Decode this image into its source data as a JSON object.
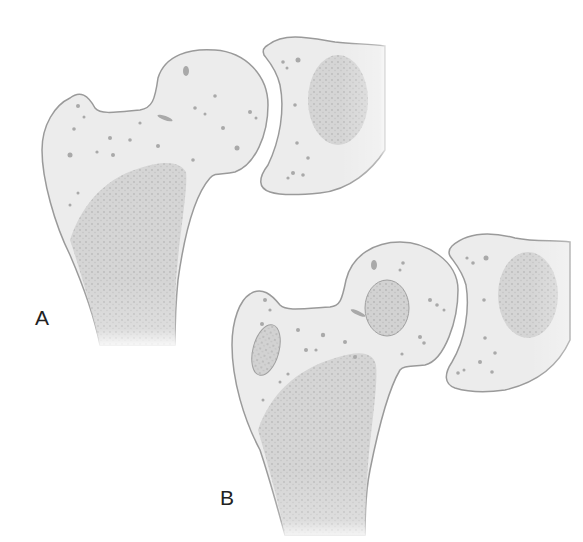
{
  "figure": {
    "panels": [
      {
        "id": "A",
        "label": "A",
        "description": "Proximal femur and acetabulum with scattered small cysts"
      },
      {
        "id": "B",
        "label": "B",
        "description": "Proximal femur and acetabulum with larger cystic lesions in head and trochanter"
      }
    ],
    "colors": {
      "bone_fill": "#ececec",
      "bone_outline": "#9a9a9a",
      "trabecular": "#c8c8c8",
      "cyst": "#a9a9a9",
      "text": "#222222"
    }
  }
}
